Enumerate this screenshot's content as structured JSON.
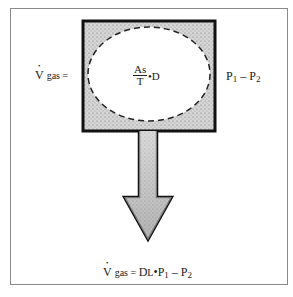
{
  "diagram": {
    "left_label": {
      "v": "V",
      "rest": "gas ="
    },
    "center": {
      "numerator": "As",
      "denominator": "T",
      "dot": "•",
      "factor": "D"
    },
    "right_label": {
      "p1": "P",
      "p1_sub": "1",
      "minus": " – ",
      "p2": "P",
      "p2_sub": "2"
    },
    "bottom_label": {
      "v": "V",
      "rest": "gas = ",
      "dl": "D",
      "dl_sub": "L",
      "dot": "•",
      "p1": "P",
      "p1_sub": "1",
      "minus": " – ",
      "p2": "P",
      "p2_sub": "2"
    },
    "colors": {
      "stipple": "#c9c9c9",
      "border": "#111111",
      "frame": "#8a8a8a"
    }
  }
}
